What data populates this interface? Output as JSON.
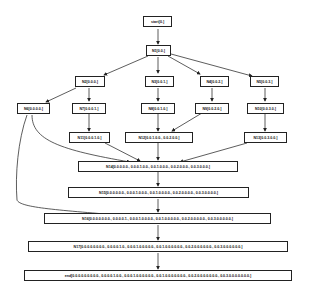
{
  "diagram": {
    "nodes": {
      "start": "start[0.]",
      "n1": "N1[0.0.]",
      "n2": "N2[0.0.0.]",
      "n3": "N3[0.0.1.]",
      "n4": "N4[0.0.2.]",
      "n5": "N5[0.0.3.]",
      "n6": "N6[0.0.0.0.]",
      "n7": "N7[0.0.0.1.]",
      "n8": "N8[0.0.1.0.]",
      "n9": "N9[0.0.2.0.]",
      "n10": "N10[0.0.3.0.]",
      "n11": "N11[0.0.0.1.0.]",
      "n12": "N12[0.0.1.0.0., 0.0.2.0.0.]",
      "n13": "N13[0.0.3.0.0.]",
      "n14": "N14[0.0.0.0.0., 0.0.0.1.0.0., 0.0.1.0.0.0., 0.0.2.0.0.0., 0.0.3.0.0.0.]",
      "n15": "N15[0.0.0.0.0.0., 0.0.0.1.0.0.0., 0.0.1.0.0.0.0., 0.0.2.0.0.0.0., 0.0.3.0.0.0.0.]",
      "n16": "N16[0.0.0.0.0.0.0., 0.0.0.0.1., 0.0.0.1.0.0.0.0., 0.0.1.0.0.0.0.0., 0.0.2.0.0.0.0.0., 0.0.3.0.0.0.0.0.]",
      "n17": "N17[0.0.0.0.0.0.0.0., 0.0.0.0.1.0., 0.0.0.1.0.0.0.0.0., 0.0.1.0.0.0.0.0.0., 0.0.2.0.0.0.0.0.0., 0.0.3.0.0.0.0.0.0.]",
      "end": "end[0.0.0.0.0.0.0.0.0., 0.0.0.0.1.0.0., 0.0.0.1.0.0.0.0.0.0., 0.0.1.0.0.0.0.0.0.0., 0.0.2.0.0.0.0.0.0.0., 0.0.3.0.0.0.0.0.0.0.]"
    },
    "edges": [
      [
        "start",
        "n1"
      ],
      [
        "n1",
        "n2"
      ],
      [
        "n1",
        "n3"
      ],
      [
        "n1",
        "n4"
      ],
      [
        "n1",
        "n5"
      ],
      [
        "n2",
        "n6"
      ],
      [
        "n2",
        "n7"
      ],
      [
        "n3",
        "n8"
      ],
      [
        "n4",
        "n9"
      ],
      [
        "n5",
        "n10"
      ],
      [
        "n7",
        "n11"
      ],
      [
        "n8",
        "n12"
      ],
      [
        "n9",
        "n12"
      ],
      [
        "n10",
        "n13"
      ],
      [
        "n6",
        "n14"
      ],
      [
        "n11",
        "n14"
      ],
      [
        "n12",
        "n14"
      ],
      [
        "n13",
        "n14"
      ],
      [
        "n14",
        "n15"
      ],
      [
        "n6",
        "n16"
      ],
      [
        "n15",
        "n16"
      ],
      [
        "n16",
        "n17"
      ],
      [
        "n17",
        "end"
      ]
    ]
  }
}
